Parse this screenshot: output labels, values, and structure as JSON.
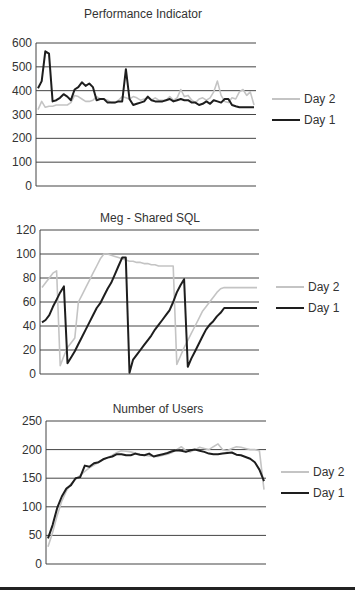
{
  "colors": {
    "day1": "#1e1e1e",
    "day2": "#c4c4c4",
    "grid": "#444444"
  },
  "chart_data": [
    {
      "type": "line",
      "title": "Performance Indicator",
      "xlabel": "",
      "ylabel": "",
      "ylim": [
        0,
        600
      ],
      "yticks": [
        0,
        100,
        200,
        300,
        400,
        500,
        600
      ],
      "grid": true,
      "legend_position": "right",
      "legend": [
        "Day 2",
        "Day 1"
      ],
      "series": [
        {
          "name": "Day 2",
          "values": [
            320,
            355,
            330,
            335,
            335,
            340,
            340,
            340,
            340,
            350,
            380,
            375,
            365,
            355,
            355,
            360,
            375,
            365,
            365,
            360,
            350,
            350,
            360,
            375,
            370,
            365,
            375,
            370,
            360,
            365,
            370,
            360,
            370,
            360,
            360,
            360,
            375,
            360,
            370,
            405,
            375,
            380,
            360,
            350,
            365,
            370,
            360,
            370,
            395,
            440,
            380,
            355,
            350,
            370,
            365,
            395,
            405,
            380,
            395,
            340
          ]
        },
        {
          "name": "Day 1",
          "values": [
            410,
            440,
            565,
            555,
            355,
            360,
            370,
            385,
            375,
            360,
            405,
            415,
            435,
            420,
            430,
            415,
            360,
            365,
            365,
            350,
            350,
            350,
            355,
            355,
            490,
            365,
            340,
            345,
            350,
            355,
            375,
            360,
            355,
            355,
            355,
            360,
            365,
            355,
            360,
            365,
            360,
            360,
            350,
            350,
            340,
            345,
            355,
            345,
            360,
            355,
            350,
            365,
            365,
            340,
            335,
            330,
            330,
            330,
            330,
            330
          ]
        }
      ]
    },
    {
      "type": "line",
      "title": "Meg - Shared SQL",
      "xlabel": "",
      "ylabel": "",
      "ylim": [
        0,
        120
      ],
      "yticks": [
        0,
        20,
        40,
        60,
        80,
        100,
        120
      ],
      "grid": true,
      "legend_position": "right",
      "legend": [
        "Day 2",
        "Day 1"
      ],
      "series": [
        {
          "name": "Day 2",
          "values": [
            72,
            76,
            80,
            84,
            86,
            7,
            15,
            22,
            26,
            30,
            60,
            66,
            72,
            78,
            84,
            90,
            96,
            100,
            100,
            99,
            98,
            97,
            96,
            95,
            94,
            94,
            93,
            93,
            92,
            92,
            91,
            91,
            90,
            90,
            90,
            90,
            90,
            8,
            15,
            22,
            28,
            34,
            40,
            46,
            52,
            56,
            60,
            64,
            68,
            71,
            72,
            72,
            72,
            72,
            72,
            72,
            72,
            72,
            72,
            72
          ]
        },
        {
          "name": "Day 1",
          "values": [
            43,
            45,
            49,
            56,
            62,
            68,
            73,
            9,
            14,
            19,
            25,
            31,
            37,
            43,
            49,
            55,
            59,
            65,
            71,
            76,
            83,
            90,
            97,
            97,
            1,
            12,
            16,
            20,
            24,
            28,
            32,
            37,
            41,
            45,
            49,
            53,
            60,
            68,
            74,
            79,
            6,
            13,
            19,
            25,
            31,
            37,
            41,
            44,
            48,
            51,
            55,
            55,
            55,
            55,
            55,
            55,
            55,
            55,
            55,
            55
          ]
        }
      ]
    },
    {
      "type": "line",
      "title": "Number of Users",
      "xlabel": "",
      "ylabel": "",
      "ylim": [
        0,
        250
      ],
      "yticks": [
        0,
        50,
        100,
        150,
        200,
        250
      ],
      "grid": true,
      "legend_position": "right",
      "legend": [
        "Day 2",
        "Day 1"
      ],
      "series": [
        {
          "name": "Day 2",
          "values": [
            30,
            55,
            85,
            110,
            128,
            140,
            148,
            155,
            162,
            168,
            173,
            178,
            182,
            186,
            190,
            195,
            198,
            197,
            196,
            194,
            192,
            190,
            189,
            188,
            188,
            190,
            192,
            195,
            200,
            205,
            198,
            196,
            200,
            204,
            202,
            200,
            205,
            210,
            200,
            198,
            202,
            205,
            204,
            202,
            200,
            200,
            198,
            130
          ]
        },
        {
          "name": "Day 1",
          "values": [
            45,
            68,
            98,
            118,
            132,
            138,
            150,
            152,
            172,
            170,
            176,
            178,
            183,
            186,
            188,
            192,
            192,
            190,
            190,
            193,
            191,
            190,
            193,
            188,
            190,
            192,
            194,
            197,
            199,
            198,
            196,
            199,
            200,
            198,
            196,
            193,
            192,
            192,
            193,
            194,
            195,
            191,
            190,
            187,
            184,
            178,
            165,
            145
          ]
        }
      ]
    }
  ]
}
